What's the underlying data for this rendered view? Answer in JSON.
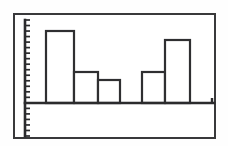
{
  "figure": {
    "kind": "printed-bar-chart",
    "background_color": "#fefefe",
    "frame": {
      "border_color": "#39393b",
      "border_width_px": 2,
      "left_px": 13,
      "top_px": 13,
      "width_px": 203,
      "height_px": 126
    },
    "ink_color": "#2f2f31"
  },
  "chart_data": {
    "type": "bar",
    "title": "",
    "subtitle": "",
    "xlabel": "",
    "ylabel": "",
    "categories": [
      "1",
      "2",
      "3",
      "4",
      "5"
    ],
    "values": [
      10.5,
      4.5,
      3.0,
      4.5,
      9.3
    ],
    "series": [
      {
        "name": "",
        "values": [
          10.5,
          4.5,
          3.0,
          4.5,
          9.3
        ]
      }
    ],
    "ylim": [
      0,
      13
    ],
    "xlim": [
      0,
      17
    ],
    "grid": false,
    "legend": null,
    "legend_position": "none",
    "annotations": [],
    "tick_labels": {
      "x": [],
      "y": []
    },
    "y_axis": {
      "has_tick_marks": true,
      "tick_count": 22,
      "tick_spacing_px": 5.4,
      "labels_shown": false,
      "extends_below_baseline": true
    },
    "x_axis": {
      "baseline_only": true,
      "labels_shown": false,
      "has_end_tick": true
    },
    "bars": [
      {
        "index": 0,
        "category": "1",
        "value": 10.5,
        "left_px": 31,
        "right_px": 59,
        "top_px": 16,
        "fill": "#ffffff",
        "outline": "#2f2f31",
        "adjacent_to_next": true
      },
      {
        "index": 1,
        "category": "2",
        "value": 4.5,
        "left_px": 59,
        "right_px": 83,
        "top_px": 57,
        "fill": "#ffffff",
        "outline": "#2f2f31",
        "adjacent_to_next": true
      },
      {
        "index": 2,
        "category": "3",
        "value": 3.0,
        "left_px": 83,
        "right_px": 105,
        "top_px": 65,
        "fill": "#ffffff",
        "outline": "#2f2f31",
        "adjacent_to_next": false
      },
      {
        "index": 3,
        "category": "4",
        "value": 4.5,
        "left_px": 127,
        "right_px": 150,
        "top_px": 57,
        "fill": "#ffffff",
        "outline": "#2f2f31",
        "adjacent_to_next": true
      },
      {
        "index": 4,
        "category": "5",
        "value": 9.3,
        "left_px": 150,
        "right_px": 175,
        "top_px": 25,
        "fill": "#ffffff",
        "outline": "#2f2f31",
        "adjacent_to_next": false
      }
    ],
    "geometry": {
      "baseline_y_px": 88,
      "axis_x_px": 10,
      "axis_top_px": 5,
      "axis_bottom_px": 121,
      "xaxis_right_px": 199
    }
  }
}
